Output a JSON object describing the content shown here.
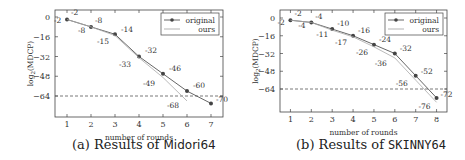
{
  "chart_data": [
    {
      "type": "line",
      "title": "",
      "caption_prefix": "(a) Results of ",
      "caption_name": "Midori64",
      "xlabel": "number of rounds",
      "ylabel": "log2(MDCP)",
      "x": [
        1,
        2,
        3,
        4,
        5,
        6,
        7
      ],
      "xticks": [
        1,
        2,
        3,
        4,
        5,
        6,
        7
      ],
      "yticks": [
        0,
        -16,
        -32,
        -48,
        -64
      ],
      "ylim": [
        -75,
        4
      ],
      "xlim": [
        0.5,
        7.5
      ],
      "threshold_line": -64,
      "grid": false,
      "legend_position": "upper right",
      "series": [
        {
          "name": "original",
          "x": [
            1,
            2,
            3,
            4,
            5,
            6,
            7
          ],
          "values": [
            -2,
            -8,
            -14,
            -32,
            -46,
            -60,
            -70
          ],
          "color": "#555555",
          "marker": "circle"
        },
        {
          "name": "ours",
          "x": [
            1,
            2,
            3,
            4,
            5,
            6
          ],
          "values": [
            -2,
            -8,
            -15,
            -33,
            -49,
            -68
          ],
          "color": "#aaaaaa",
          "marker": "none"
        }
      ]
    },
    {
      "type": "line",
      "title": "",
      "caption_prefix": "(b) Results of ",
      "caption_name": "SKINNY64",
      "xlabel": "number of rounds",
      "ylabel": "log2(MDCP)",
      "x": [
        1,
        2,
        3,
        4,
        5,
        6,
        7,
        8
      ],
      "xticks": [
        1,
        2,
        3,
        4,
        5,
        6,
        7,
        8
      ],
      "yticks": [
        0,
        -16,
        -32,
        -48,
        -64
      ],
      "ylim": [
        -78,
        4
      ],
      "xlim": [
        0.5,
        8.5
      ],
      "threshold_line": -64,
      "grid": false,
      "legend_position": "upper right",
      "series": [
        {
          "name": "original",
          "x": [
            1,
            2,
            3,
            4,
            5,
            6,
            7,
            8
          ],
          "values": [
            -2,
            -4,
            -10,
            -16,
            -24,
            -32,
            -52,
            -72
          ],
          "color": "#555555",
          "marker": "circle"
        },
        {
          "name": "ours",
          "x": [
            1,
            2,
            3,
            4,
            5,
            6,
            7,
            8
          ],
          "values": [
            -2,
            -4,
            -11,
            -17,
            -26,
            -36,
            -56,
            -76
          ],
          "color": "#aaaaaa",
          "marker": "none"
        }
      ]
    }
  ],
  "captions": {
    "a_prefix": "(a) Results of ",
    "a_name": "Midori64",
    "b_prefix": "(b) Results of ",
    "b_name": "SKINNY64"
  }
}
